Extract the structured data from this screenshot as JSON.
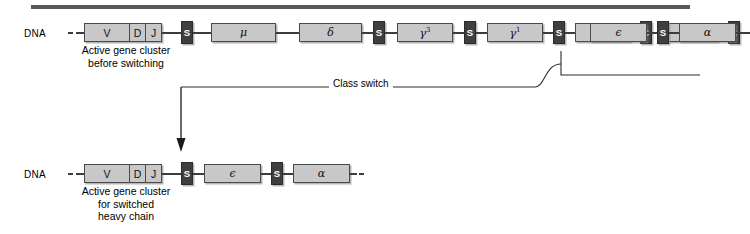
{
  "figure": {
    "top_rule_color": "#595959",
    "box_fill": "#c8c8c8",
    "switch_box_fill": "#3f3f3f",
    "line_color": "#3d3d3d"
  },
  "top_strand": {
    "dna_label": "DNA",
    "caption_line1": "Active gene cluster",
    "caption_line2": "before switching",
    "vdj": {
      "v": "V",
      "d": "D",
      "j": "J"
    },
    "switch_region_label": "S",
    "genes": [
      {
        "label": "μ",
        "sup": ""
      },
      {
        "label": "δ",
        "sup": ""
      },
      {
        "label": "γ",
        "sup": "3"
      },
      {
        "label": "γ",
        "sup": "1"
      },
      {
        "label": "γ",
        "sup": "2b"
      },
      {
        "label": "γ",
        "sup": "2a"
      },
      {
        "label": "ϵ",
        "sup": ""
      },
      {
        "label": "α",
        "sup": ""
      }
    ]
  },
  "bottom_strand": {
    "dna_label": "DNA",
    "caption_line1": "Active gene cluster",
    "caption_line2": "for switched",
    "caption_line3": "heavy chain",
    "vdj": {
      "v": "V",
      "d": "D",
      "j": "J"
    },
    "switch_region_label": "S",
    "genes": [
      {
        "label": "ϵ",
        "sup": ""
      },
      {
        "label": "α",
        "sup": ""
      }
    ]
  },
  "annotation": {
    "class_switch_label": "Class switch"
  }
}
